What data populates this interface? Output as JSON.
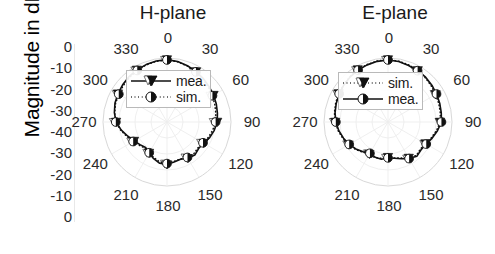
{
  "figure": {
    "ylabel": "Magnitude in dB",
    "ytick_labels": [
      "0",
      "-10",
      "-20",
      "-30",
      "-40",
      "-30",
      "-20",
      "-10",
      "0"
    ]
  },
  "panels": [
    {
      "id": "h-plane",
      "title": "H-plane",
      "angle_labels": [
        "0",
        "30",
        "60",
        "90",
        "120",
        "150",
        "180",
        "210",
        "240",
        "270",
        "300",
        "330"
      ],
      "legend": [
        {
          "label": "mea.",
          "style": "solid",
          "marker": "triangle-down"
        },
        {
          "label": "sim.",
          "style": "dotted",
          "marker": "circle-half"
        }
      ]
    },
    {
      "id": "e-plane",
      "title": "E-plane",
      "angle_labels": [
        "0",
        "30",
        "60",
        "90",
        "120",
        "150",
        "180",
        "210",
        "240",
        "270",
        "300",
        "330"
      ],
      "legend": [
        {
          "label": "sim.",
          "style": "dotted",
          "marker": "triangle-down"
        },
        {
          "label": "mea.",
          "style": "solid",
          "marker": "circle-half"
        }
      ]
    }
  ],
  "chart_data": [
    {
      "type": "line",
      "plot": "polar",
      "title": "H-plane",
      "xlabel": "",
      "ylabel": "Magnitude in dB",
      "rlim": [
        -40,
        0
      ],
      "r_ticks": [
        0,
        -10,
        -20,
        -30,
        -40
      ],
      "theta_ticks": [
        0,
        30,
        60,
        90,
        120,
        150,
        180,
        210,
        240,
        270,
        300,
        330
      ],
      "theta_direction": "clockwise",
      "theta_zero": "north",
      "grid": true,
      "legend_position": "center",
      "series": [
        {
          "name": "mea.",
          "style": "solid",
          "marker": "triangle-down",
          "theta": [
            0,
            10,
            20,
            30,
            40,
            50,
            60,
            70,
            80,
            90,
            100,
            110,
            120,
            130,
            140,
            150,
            160,
            170,
            180,
            190,
            200,
            210,
            220,
            230,
            240,
            250,
            260,
            270,
            280,
            290,
            300,
            310,
            320,
            330,
            340,
            350,
            360
          ],
          "values_db": [
            -1.0,
            -1.6,
            -2.6,
            -3.6,
            -4.6,
            -5.6,
            -6.4,
            -7.2,
            -8.0,
            -8.6,
            -10.0,
            -11.6,
            -13.6,
            -14.2,
            -13.0,
            -13.8,
            -15.2,
            -14.6,
            -13.4,
            -13.8,
            -15.6,
            -17.6,
            -19.2,
            -18.0,
            -16.2,
            -14.0,
            -11.0,
            -8.2,
            -6.6,
            -5.4,
            -4.6,
            -3.8,
            -3.0,
            -2.4,
            -1.8,
            -1.3,
            -1.0
          ]
        },
        {
          "name": "sim.",
          "style": "dotted",
          "marker": "circle-half",
          "theta": [
            0,
            10,
            20,
            30,
            40,
            50,
            60,
            70,
            80,
            90,
            100,
            110,
            120,
            130,
            140,
            150,
            160,
            170,
            180,
            190,
            200,
            210,
            220,
            230,
            240,
            250,
            260,
            270,
            280,
            290,
            300,
            310,
            320,
            330,
            340,
            350,
            360
          ],
          "values_db": [
            -1.2,
            -1.8,
            -2.8,
            -3.8,
            -5.0,
            -6.2,
            -7.2,
            -8.2,
            -9.0,
            -9.6,
            -11.0,
            -12.4,
            -14.0,
            -14.8,
            -14.0,
            -14.4,
            -15.4,
            -15.0,
            -14.0,
            -14.6,
            -16.2,
            -17.8,
            -18.6,
            -17.4,
            -15.6,
            -13.4,
            -10.6,
            -8.0,
            -6.8,
            -5.8,
            -5.2,
            -4.4,
            -3.6,
            -2.8,
            -2.0,
            -1.5,
            -1.2
          ]
        }
      ]
    },
    {
      "type": "line",
      "plot": "polar",
      "title": "E-plane",
      "xlabel": "",
      "ylabel": "Magnitude in dB",
      "rlim": [
        -40,
        0
      ],
      "r_ticks": [
        0,
        -10,
        -20,
        -30,
        -40
      ],
      "theta_ticks": [
        0,
        30,
        60,
        90,
        120,
        150,
        180,
        210,
        240,
        270,
        300,
        330
      ],
      "theta_direction": "clockwise",
      "theta_zero": "north",
      "grid": true,
      "legend_position": "center",
      "series": [
        {
          "name": "sim.",
          "style": "dotted",
          "marker": "triangle-down",
          "theta": [
            0,
            10,
            20,
            30,
            40,
            50,
            60,
            70,
            80,
            90,
            100,
            110,
            120,
            130,
            140,
            150,
            160,
            170,
            180,
            190,
            200,
            210,
            220,
            230,
            240,
            250,
            260,
            270,
            280,
            290,
            300,
            310,
            320,
            330,
            340,
            350,
            360
          ],
          "values_db": [
            -1.0,
            -1.4,
            -2.0,
            -2.8,
            -3.8,
            -4.8,
            -5.6,
            -6.2,
            -6.8,
            -7.4,
            -9.2,
            -11.2,
            -13.0,
            -13.6,
            -12.6,
            -14.0,
            -16.0,
            -17.2,
            -18.0,
            -17.0,
            -16.2,
            -16.8,
            -15.4,
            -13.4,
            -11.6,
            -10.0,
            -8.4,
            -7.0,
            -6.0,
            -5.2,
            -4.4,
            -3.8,
            -3.0,
            -2.2,
            -1.8,
            -1.3,
            -1.0
          ]
        },
        {
          "name": "mea.",
          "style": "solid",
          "marker": "circle-half",
          "theta": [
            0,
            10,
            20,
            30,
            40,
            50,
            60,
            70,
            80,
            90,
            100,
            110,
            120,
            130,
            140,
            150,
            160,
            170,
            180,
            190,
            200,
            210,
            220,
            230,
            240,
            250,
            260,
            270,
            280,
            290,
            300,
            310,
            320,
            330,
            340,
            350,
            360
          ],
          "values_db": [
            -1.2,
            -1.6,
            -2.4,
            -3.0,
            -3.4,
            -4.2,
            -5.0,
            -5.6,
            -6.2,
            -6.6,
            -8.6,
            -10.6,
            -12.4,
            -13.0,
            -12.0,
            -13.6,
            -15.6,
            -17.0,
            -17.6,
            -16.4,
            -16.6,
            -17.4,
            -15.8,
            -13.8,
            -12.0,
            -10.4,
            -8.8,
            -7.4,
            -6.4,
            -5.6,
            -4.8,
            -4.0,
            -3.2,
            -2.6,
            -2.0,
            -1.5,
            -1.2
          ]
        }
      ]
    }
  ]
}
